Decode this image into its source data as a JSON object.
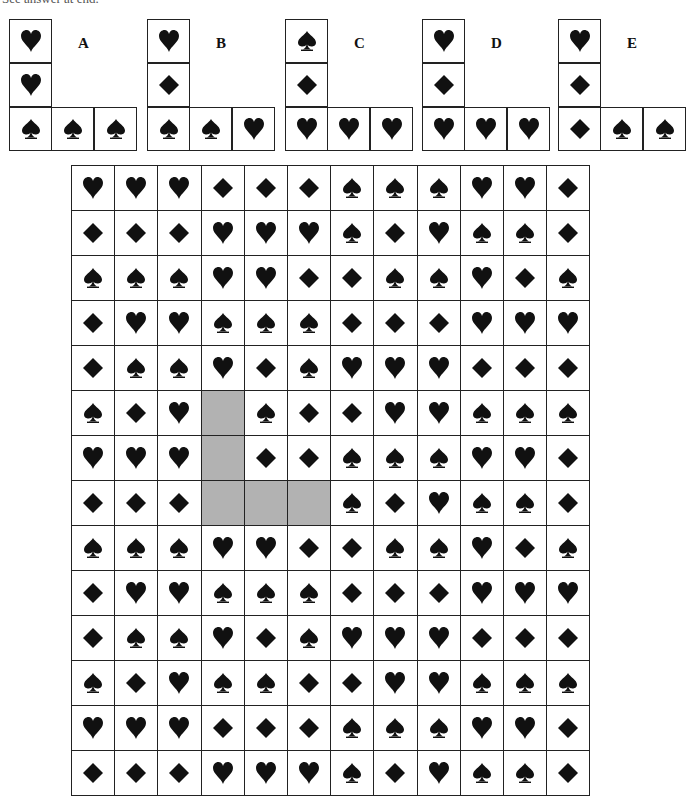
{
  "header": {
    "text": "See answer at end."
  },
  "symbols": {
    "H": "heart-icon",
    "D": "diamond-icon",
    "S": "spade-icon"
  },
  "colors": {
    "suit": "#111111",
    "blank": "#b2b2b2",
    "border": "#222222"
  },
  "options": [
    {
      "label": "A",
      "left": 9,
      "vertical": [
        "H",
        "H",
        "S"
      ],
      "horizontal": [
        "S",
        "S"
      ]
    },
    {
      "label": "B",
      "left": 147,
      "vertical": [
        "H",
        "D",
        "S"
      ],
      "horizontal": [
        "S",
        "H"
      ]
    },
    {
      "label": "C",
      "left": 285,
      "vertical": [
        "S",
        "D",
        "H"
      ],
      "horizontal": [
        "H",
        "H"
      ]
    },
    {
      "label": "D",
      "left": 422,
      "vertical": [
        "H",
        "D",
        "H"
      ],
      "horizontal": [
        "H",
        "H"
      ]
    },
    {
      "label": "E",
      "left": 558,
      "vertical": [
        "H",
        "D",
        "D"
      ],
      "horizontal": [
        "S",
        "S"
      ]
    }
  ],
  "grid": {
    "rows": [
      [
        "H",
        "H",
        "H",
        "D",
        "D",
        "D",
        "S",
        "S",
        "S",
        "H",
        "H",
        "D"
      ],
      [
        "D",
        "D",
        "D",
        "H",
        "H",
        "H",
        "S",
        "D",
        "H",
        "S",
        "S",
        "D"
      ],
      [
        "S",
        "S",
        "S",
        "H",
        "H",
        "D",
        "D",
        "S",
        "S",
        "H",
        "D",
        "S"
      ],
      [
        "D",
        "H",
        "H",
        "S",
        "S",
        "S",
        "D",
        "D",
        "D",
        "H",
        "H",
        "H"
      ],
      [
        "D",
        "S",
        "S",
        "H",
        "D",
        "S",
        "H",
        "H",
        "H",
        "D",
        "D",
        "D"
      ],
      [
        "S",
        "D",
        "H",
        "_",
        "S",
        "D",
        "D",
        "H",
        "H",
        "S",
        "S",
        "S"
      ],
      [
        "H",
        "H",
        "H",
        "_",
        "D",
        "D",
        "S",
        "S",
        "S",
        "H",
        "H",
        "D"
      ],
      [
        "D",
        "D",
        "D",
        "_",
        "_",
        "_",
        "S",
        "D",
        "H",
        "S",
        "S",
        "D"
      ],
      [
        "S",
        "S",
        "S",
        "H",
        "H",
        "D",
        "D",
        "S",
        "S",
        "H",
        "D",
        "S"
      ],
      [
        "D",
        "H",
        "H",
        "S",
        "S",
        "S",
        "D",
        "D",
        "D",
        "H",
        "H",
        "H"
      ],
      [
        "D",
        "S",
        "S",
        "H",
        "D",
        "S",
        "H",
        "H",
        "H",
        "D",
        "D",
        "D"
      ],
      [
        "S",
        "D",
        "H",
        "S",
        "S",
        "D",
        "D",
        "H",
        "H",
        "S",
        "S",
        "S"
      ],
      [
        "H",
        "H",
        "H",
        "D",
        "D",
        "D",
        "S",
        "S",
        "S",
        "H",
        "H",
        "D"
      ],
      [
        "D",
        "D",
        "D",
        "H",
        "H",
        "H",
        "S",
        "D",
        "H",
        "S",
        "S",
        "D"
      ]
    ]
  }
}
